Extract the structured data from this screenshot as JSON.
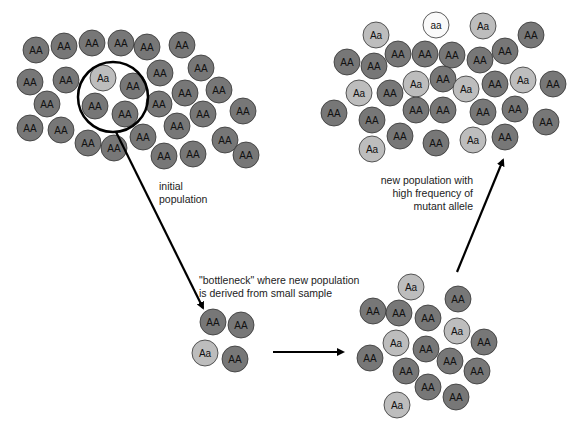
{
  "colors": {
    "AA": "#777777",
    "Aa": "#bdbdbd",
    "aa": "#fafafa",
    "stroke": "#333333"
  },
  "labels": {
    "initial": [
      "initial",
      "population"
    ],
    "bottleneck": [
      "\"bottleneck\" where new population",
      "is derived from small sample"
    ],
    "new_population": [
      "new population with",
      "high frequency of",
      "mutant allele"
    ]
  },
  "populations": {
    "initial": [
      [
        36,
        50,
        "AA"
      ],
      [
        64,
        46,
        "AA"
      ],
      [
        92,
        43,
        "AA"
      ],
      [
        121,
        43,
        "AA"
      ],
      [
        147,
        47,
        "AA"
      ],
      [
        182,
        45,
        "AA"
      ],
      [
        201,
        68,
        "AA"
      ],
      [
        30,
        82,
        "AA"
      ],
      [
        66,
        80,
        "AA"
      ],
      [
        103,
        78,
        "Aa"
      ],
      [
        133,
        86,
        "AA"
      ],
      [
        160,
        73,
        "AA"
      ],
      [
        47,
        104,
        "AA"
      ],
      [
        95,
        106,
        "AA"
      ],
      [
        125,
        114,
        "AA"
      ],
      [
        159,
        104,
        "AA"
      ],
      [
        185,
        93,
        "AA"
      ],
      [
        219,
        90,
        "AA"
      ],
      [
        30,
        128,
        "AA"
      ],
      [
        61,
        130,
        "AA"
      ],
      [
        88,
        143,
        "AA"
      ],
      [
        114,
        148,
        "AA"
      ],
      [
        143,
        137,
        "AA"
      ],
      [
        177,
        126,
        "AA"
      ],
      [
        203,
        114,
        "AA"
      ],
      [
        243,
        111,
        "AA"
      ],
      [
        164,
        156,
        "AA"
      ],
      [
        193,
        154,
        "AA"
      ],
      [
        225,
        140,
        "AA"
      ],
      [
        246,
        155,
        "AA"
      ]
    ],
    "sample": [
      [
        213,
        322,
        "AA"
      ],
      [
        241,
        325,
        "AA"
      ],
      [
        205,
        353,
        "Aa"
      ],
      [
        235,
        359,
        "AA"
      ]
    ],
    "regrown": [
      [
        411,
        287,
        "Aa"
      ],
      [
        373,
        311,
        "AA"
      ],
      [
        399,
        313,
        "AA"
      ],
      [
        428,
        318,
        "AA"
      ],
      [
        458,
        299,
        "AA"
      ],
      [
        457,
        331,
        "Aa"
      ],
      [
        396,
        343,
        "Aa"
      ],
      [
        426,
        349,
        "AA"
      ],
      [
        484,
        342,
        "AA"
      ],
      [
        370,
        358,
        "AA"
      ],
      [
        406,
        371,
        "AA"
      ],
      [
        450,
        361,
        "AA"
      ],
      [
        477,
        371,
        "AA"
      ],
      [
        428,
        387,
        "AA"
      ],
      [
        456,
        397,
        "AA"
      ],
      [
        397,
        405,
        "Aa"
      ]
    ],
    "new": [
      [
        376,
        35,
        "Aa"
      ],
      [
        436,
        25,
        "aa"
      ],
      [
        483,
        26,
        "Aa"
      ],
      [
        531,
        35,
        "AA"
      ],
      [
        347,
        62,
        "AA"
      ],
      [
        374,
        66,
        "AA"
      ],
      [
        398,
        54,
        "AA"
      ],
      [
        425,
        54,
        "AA"
      ],
      [
        452,
        55,
        "AA"
      ],
      [
        480,
        60,
        "AA"
      ],
      [
        505,
        51,
        "AA"
      ],
      [
        359,
        93,
        "Aa"
      ],
      [
        390,
        93,
        "AA"
      ],
      [
        416,
        84,
        "Aa"
      ],
      [
        443,
        79,
        "AA"
      ],
      [
        466,
        89,
        "Aa"
      ],
      [
        495,
        84,
        "AA"
      ],
      [
        523,
        80,
        "Aa"
      ],
      [
        553,
        84,
        "AA"
      ],
      [
        334,
        113,
        "AA"
      ],
      [
        372,
        120,
        "AA"
      ],
      [
        416,
        110,
        "AA"
      ],
      [
        443,
        110,
        "AA"
      ],
      [
        483,
        112,
        "AA"
      ],
      [
        515,
        109,
        "AA"
      ],
      [
        546,
        122,
        "AA"
      ],
      [
        372,
        149,
        "Aa"
      ],
      [
        400,
        136,
        "AA"
      ],
      [
        436,
        143,
        "AA"
      ],
      [
        473,
        140,
        "Aa"
      ],
      [
        505,
        137,
        "AA"
      ]
    ]
  },
  "sample_circle": {
    "cx": 113,
    "cy": 97,
    "r": 35
  },
  "arrows": [
    {
      "x1": 116,
      "y1": 132,
      "x2": 203,
      "y2": 308
    },
    {
      "x1": 273,
      "y1": 352,
      "x2": 343,
      "y2": 352
    },
    {
      "x1": 457,
      "y1": 272,
      "x2": 503,
      "y2": 160
    }
  ]
}
